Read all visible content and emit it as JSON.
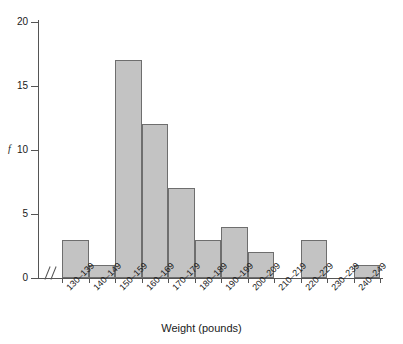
{
  "chart_data": {
    "type": "bar",
    "title": "",
    "xlabel": "Weight (pounds)",
    "ylabel": "f",
    "categories": [
      "130–139",
      "140–149",
      "150–159",
      "160–169",
      "170–179",
      "180–189",
      "190–199",
      "200–209",
      "210–219",
      "220–229",
      "230–239",
      "240–249"
    ],
    "values": [
      3,
      1,
      17,
      12,
      7,
      3,
      4,
      2,
      0,
      3,
      0,
      1
    ],
    "ylim": [
      0,
      20
    ],
    "yticks": [
      0,
      5,
      10,
      15,
      20
    ],
    "ytick_labels": [
      "0",
      "5",
      "10",
      "15",
      "20"
    ],
    "grid": false,
    "legend": false,
    "bar_fill_color": "#c3c3c3",
    "bar_edge_color": "#6e6e6e",
    "axis_color": "#555555",
    "background_color": "#ffffff",
    "axis_break": "//",
    "axis_break_note": "x-axis scale break between origin and first class"
  }
}
